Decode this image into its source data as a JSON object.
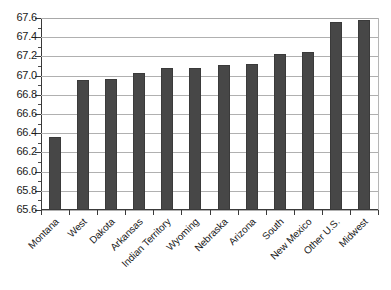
{
  "chart_data": {
    "type": "bar",
    "title": "",
    "subtitle": "",
    "xlabel": "",
    "ylabel": "",
    "ylim": [
      65.6,
      67.6
    ],
    "ytick_step": 0.2,
    "grid": true,
    "legend": "none",
    "orientation": "vertical",
    "bar_color": "#474747",
    "categories": [
      "Montana",
      "West",
      "Dakota",
      "Arkansas",
      "Indian Territory",
      "Wyoming",
      "Nebraska",
      "Arizona",
      "South",
      "New Mexico",
      "Other U.S.",
      "Midwest"
    ],
    "values": [
      66.36,
      66.95,
      66.96,
      67.03,
      67.08,
      67.08,
      67.11,
      67.12,
      67.22,
      67.25,
      67.56,
      67.58
    ],
    "ytick_labels": [
      "67.6",
      "67.4",
      "67.2",
      "67.0",
      "66.8",
      "66.6",
      "66.4",
      "66.2",
      "66.0",
      "65.8",
      "65.6"
    ]
  }
}
